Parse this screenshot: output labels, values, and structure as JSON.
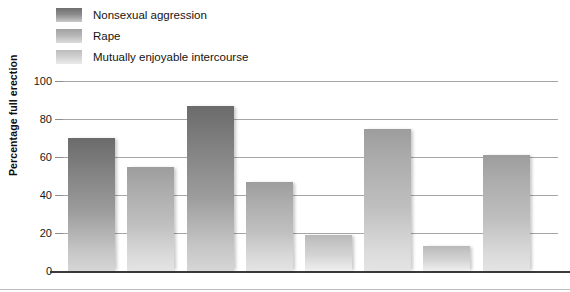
{
  "legend": {
    "items": [
      {
        "label": "Nonsexual aggression",
        "tone": "dark",
        "color": "#7d7d7d"
      },
      {
        "label": "Rape",
        "tone": "mid",
        "color": "#ababab"
      },
      {
        "label": "Mutually enjoyable intercourse",
        "tone": "light",
        "color": "#c4c4c4"
      }
    ]
  },
  "axis": {
    "ylabel": "Percentage full erection",
    "yticks": [
      "0",
      "20",
      "40",
      "60",
      "80",
      "100"
    ]
  },
  "chart_data": {
    "type": "bar",
    "title": "",
    "xlabel": "",
    "ylabel": "Percentage full erection",
    "ylim": [
      0,
      100
    ],
    "yticks": [
      0,
      20,
      40,
      60,
      80,
      100
    ],
    "grid": true,
    "legend_position": "top-left",
    "categories": [
      "",
      "",
      "",
      "",
      "",
      "",
      "",
      ""
    ],
    "values": [
      70,
      55,
      87,
      47,
      19,
      75,
      13,
      61
    ],
    "bar_tones": [
      "dark",
      "mid",
      "dark",
      "mid",
      "light",
      "mid",
      "light",
      "mid"
    ],
    "series": [
      {
        "name": "Percentage full erection",
        "values": [
          70,
          55,
          87,
          47,
          19,
          75,
          13,
          61
        ]
      }
    ],
    "legend_entries": [
      "Nonsexual aggression",
      "Rape",
      "Mutually enjoyable intercourse"
    ]
  }
}
